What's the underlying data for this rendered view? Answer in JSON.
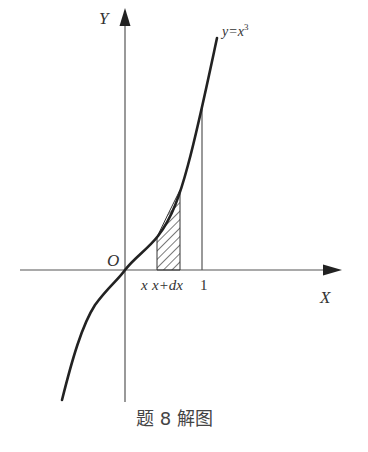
{
  "diagram": {
    "caption": "题 8 解图",
    "axes": {
      "y_label": "Y",
      "x_label": "X",
      "origin_label": "O"
    },
    "curve_label_prefix": "y=x",
    "curve_label_exponent": "3",
    "tick_labels": {
      "x": "x",
      "x_plus_dx_prefix": "x+d",
      "x_plus_dx_suffix": "x",
      "one": "1"
    },
    "colors": {
      "ink": "#222222",
      "axis": "#555555",
      "background": "#ffffff"
    }
  }
}
